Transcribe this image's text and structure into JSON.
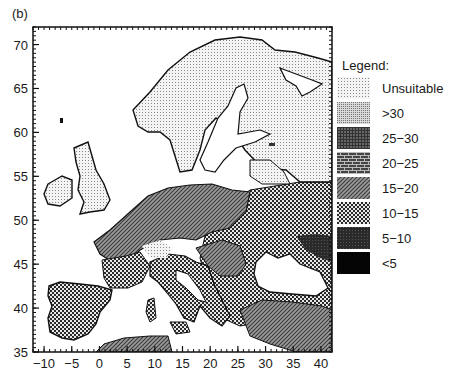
{
  "figure": {
    "panel_label": "(b)"
  },
  "axes": {
    "x_ticks": [
      "-10",
      "-5",
      "0",
      "5",
      "10",
      "15",
      "20",
      "25",
      "30",
      "35",
      "40"
    ],
    "x_tick_values": [
      -10,
      -5,
      0,
      5,
      10,
      15,
      20,
      25,
      30,
      35,
      40
    ],
    "y_ticks": [
      "70",
      "65",
      "60",
      "55",
      "50",
      "45",
      "40",
      "35"
    ],
    "y_tick_values": [
      70,
      65,
      60,
      55,
      50,
      45,
      40,
      35
    ],
    "x_range": [
      -12,
      42
    ],
    "y_range": [
      35,
      72
    ],
    "x_meaning": "longitude (degrees)",
    "y_meaning": "latitude (degrees)"
  },
  "legend": {
    "title": "Legend:",
    "items": [
      {
        "label": "Unsuitable",
        "pattern": "fine-dots"
      },
      {
        "label": ">30",
        "pattern": "dense-dots"
      },
      {
        "label": "25−30",
        "pattern": "grid"
      },
      {
        "label": "20−25",
        "pattern": "bricks"
      },
      {
        "label": "15−20",
        "pattern": "diagonal-hatch"
      },
      {
        "label": "10−15",
        "pattern": "checkerboard"
      },
      {
        "label": "5−10",
        "pattern": "dark-grid"
      },
      {
        "label": "<5",
        "pattern": "solid-black"
      }
    ]
  },
  "colors": {
    "ink": "#1a1a1a",
    "background": "#ffffff"
  }
}
